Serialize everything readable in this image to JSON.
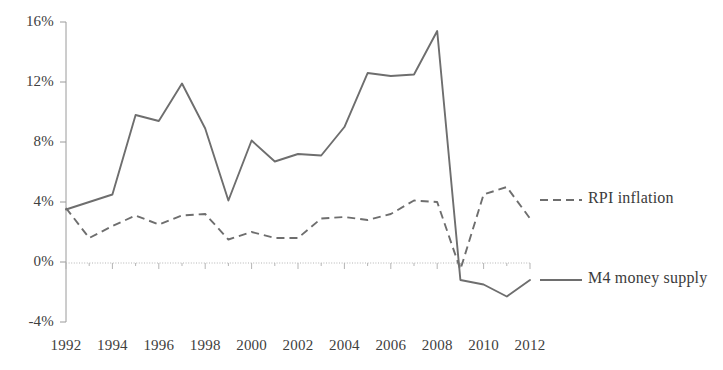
{
  "chart_data": {
    "type": "line",
    "title": "",
    "subtitle": "",
    "xlabel": "",
    "ylabel": "",
    "xlim": [
      1992,
      2012
    ],
    "ylim": [
      -4,
      16
    ],
    "yticks": [
      "-4%",
      "0%",
      "4%",
      "8%",
      "12%",
      "16%"
    ],
    "ytick_values": [
      -4,
      0,
      4,
      8,
      12,
      16
    ],
    "xticks": [
      "1992",
      "1994",
      "1996",
      "1998",
      "2000",
      "2002",
      "2004",
      "2006",
      "2008",
      "2010",
      "2012"
    ],
    "xtick_values": [
      1992,
      1994,
      1996,
      1998,
      2000,
      2002,
      2004,
      2006,
      2008,
      2010,
      2012
    ],
    "grid": false,
    "zero_line": true,
    "legend_position": "right",
    "x": [
      1992,
      1993,
      1994,
      1995,
      1996,
      1997,
      1998,
      1999,
      2000,
      2001,
      2002,
      2003,
      2004,
      2005,
      2006,
      2007,
      2008,
      2009,
      2010,
      2011,
      2012
    ],
    "series": [
      {
        "name": "RPI inflation",
        "style": "dashed",
        "color": "#6e6e6e",
        "values": [
          3.6,
          1.6,
          2.4,
          3.1,
          2.5,
          3.1,
          3.2,
          1.5,
          2.0,
          1.6,
          1.6,
          2.9,
          3.0,
          2.8,
          3.2,
          4.1,
          4.0,
          -0.5,
          4.5,
          5.0,
          2.9
        ]
      },
      {
        "name": "M4 money supply",
        "style": "solid",
        "color": "#6e6e6e",
        "values": [
          3.5,
          4.0,
          4.5,
          9.8,
          9.4,
          11.9,
          8.9,
          4.1,
          8.1,
          6.7,
          7.2,
          7.1,
          9.0,
          12.6,
          12.4,
          12.5,
          15.4,
          -1.2,
          -1.5,
          -2.3,
          -1.2
        ]
      }
    ]
  },
  "legend": {
    "items": [
      {
        "label": "RPI inflation",
        "style": "dashed"
      },
      {
        "label": "M4 money supply",
        "style": "solid"
      }
    ]
  }
}
